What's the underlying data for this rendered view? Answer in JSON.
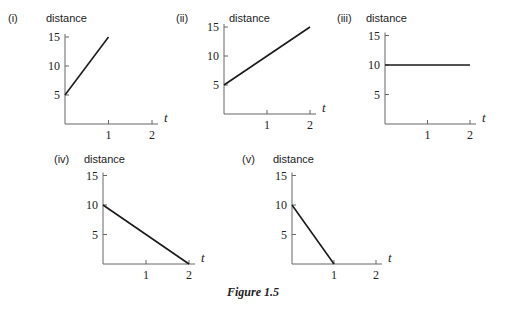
{
  "caption": "Figure 1.5",
  "chart_data": [
    {
      "type": "line",
      "panel": "(i)",
      "ylabel": "distance",
      "xlabel": "t",
      "x_ticks": [
        "1",
        "2"
      ],
      "y_ticks": [
        "5",
        "10",
        "15"
      ],
      "xlim": [
        0,
        2
      ],
      "ylim": [
        0,
        15
      ],
      "grid": false,
      "series": [
        {
          "name": "distance",
          "x": [
            0,
            1
          ],
          "y": [
            5,
            15
          ]
        }
      ]
    },
    {
      "type": "line",
      "panel": "(ii)",
      "ylabel": "distance",
      "xlabel": "t",
      "x_ticks": [
        "1",
        "2"
      ],
      "y_ticks": [
        "5",
        "10",
        "15"
      ],
      "xlim": [
        0,
        2
      ],
      "ylim": [
        0,
        15
      ],
      "grid": false,
      "series": [
        {
          "name": "distance",
          "x": [
            0,
            2
          ],
          "y": [
            5,
            15
          ]
        }
      ]
    },
    {
      "type": "line",
      "panel": "(iii)",
      "ylabel": "distance",
      "xlabel": "t",
      "x_ticks": [
        "1",
        "2"
      ],
      "y_ticks": [
        "5",
        "10",
        "15"
      ],
      "xlim": [
        0,
        2
      ],
      "ylim": [
        0,
        15
      ],
      "grid": false,
      "series": [
        {
          "name": "distance",
          "x": [
            0,
            2
          ],
          "y": [
            10,
            10
          ]
        }
      ]
    },
    {
      "type": "line",
      "panel": "(iv)",
      "ylabel": "distance",
      "xlabel": "t",
      "x_ticks": [
        "1",
        "2"
      ],
      "y_ticks": [
        "5",
        "10",
        "15"
      ],
      "xlim": [
        0,
        2
      ],
      "ylim": [
        0,
        15
      ],
      "grid": false,
      "series": [
        {
          "name": "distance",
          "x": [
            0,
            2
          ],
          "y": [
            10,
            0
          ]
        }
      ]
    },
    {
      "type": "line",
      "panel": "(v)",
      "ylabel": "distance",
      "xlabel": "t",
      "x_ticks": [
        "1",
        "2"
      ],
      "y_ticks": [
        "5",
        "10",
        "15"
      ],
      "xlim": [
        0,
        2
      ],
      "ylim": [
        0,
        15
      ],
      "grid": false,
      "series": [
        {
          "name": "distance",
          "x": [
            0,
            1
          ],
          "y": [
            10,
            0
          ]
        }
      ]
    }
  ],
  "layout": [
    {
      "ox": 65,
      "oy": 124,
      "ux": 43.5,
      "uy": 5.8,
      "label_x": 8,
      "label_y": 22,
      "ylabel_x": 46,
      "ylabel_y": 22
    },
    {
      "ox": 224,
      "oy": 114,
      "ux": 43,
      "uy": 5.8,
      "label_x": 176,
      "label_y": 22,
      "ylabel_x": 229,
      "ylabel_y": 22
    },
    {
      "ox": 385,
      "oy": 124,
      "ux": 42.5,
      "uy": 5.9,
      "label_x": 337,
      "label_y": 22,
      "ylabel_x": 366,
      "ylabel_y": 22
    },
    {
      "ox": 103,
      "oy": 264,
      "ux": 43,
      "uy": 5.9,
      "label_x": 54,
      "label_y": 163,
      "ylabel_x": 84,
      "ylabel_y": 163
    },
    {
      "ox": 292,
      "oy": 264,
      "ux": 42,
      "uy": 5.9,
      "label_x": 242,
      "label_y": 163,
      "ylabel_x": 273,
      "ylabel_y": 163
    }
  ]
}
